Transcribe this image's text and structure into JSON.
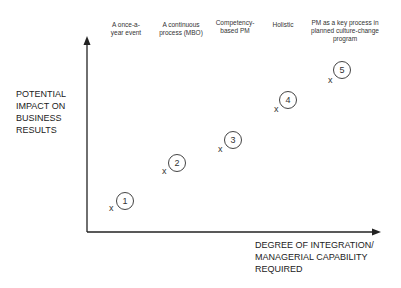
{
  "diagram": {
    "y_axis_label": [
      "POTENTIAL",
      "IMPACT ON",
      "BUSINESS",
      "RESULTS"
    ],
    "x_axis_label": [
      "DEGREE OF INTEGRATION/",
      "MANAGERIAL CAPABILITY",
      "REQUIRED"
    ],
    "stages": [
      {
        "number": "1",
        "marker": "x",
        "label": [
          "A once-a-",
          "year event"
        ]
      },
      {
        "number": "2",
        "marker": "x",
        "label": [
          "A continuous",
          "process (MBO)"
        ]
      },
      {
        "number": "3",
        "marker": "x",
        "label": [
          "Competency-",
          "based PM"
        ]
      },
      {
        "number": "4",
        "marker": "x",
        "label": [
          "Holistic"
        ]
      },
      {
        "number": "5",
        "marker": "x",
        "label": [
          "PM as a key process in",
          "planned culture-change",
          "program"
        ]
      }
    ]
  }
}
